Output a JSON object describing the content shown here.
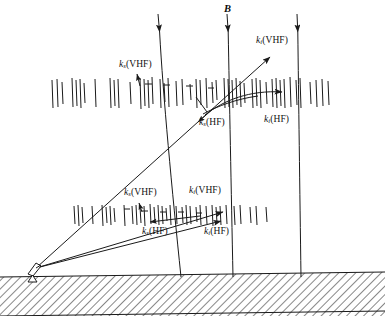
{
  "figure": {
    "kind": "ionospheric-radar-scattering-diagram",
    "background_color": "#ffffff",
    "line_color": "#1a1a1a",
    "width": 385,
    "height": 316
  },
  "magnetic_field": {
    "label": "B",
    "label_position": {
      "x": 224,
      "y": 4
    },
    "arrow_direction": "downward",
    "field_lines": [
      {
        "top_x": 158,
        "top_y": 18,
        "bottom_x": 181,
        "bottom_y": 277
      },
      {
        "top_x": 227,
        "top_y": 18,
        "bottom_x": 233,
        "bottom_y": 277
      },
      {
        "top_x": 297,
        "top_y": 18,
        "bottom_x": 301,
        "bottom_y": 277
      }
    ]
  },
  "labels": {
    "upper_ks_vhf": {
      "k": "k",
      "sub": "s",
      "paren": "(VHF)",
      "x": 119,
      "y": 62
    },
    "upper_ki_vhf": {
      "k": "k",
      "sub": "i",
      "paren": "(VHF)",
      "x": 256,
      "y": 38
    },
    "upper_ks_hf": {
      "k": "k",
      "sub": "s",
      "paren": "(HF)",
      "x": 200,
      "y": 120
    },
    "upper_ki_hf": {
      "k": "k",
      "sub": "i",
      "paren": "(HF)",
      "x": 265,
      "y": 117
    },
    "lower_ks_vhf": {
      "k": "k",
      "sub": "s",
      "paren": "(VHF)",
      "x": 125,
      "y": 190
    },
    "lower_ki_vhf": {
      "k": "k",
      "sub": "i",
      "paren": "(VHF)",
      "x": 190,
      "y": 188
    },
    "lower_ks_hf": {
      "k": "k",
      "sub": "s",
      "paren": "(HF)",
      "x": 143,
      "y": 229
    },
    "lower_ki_hf": {
      "k": "k",
      "sub": "i",
      "paren": "(HF)",
      "x": 205,
      "y": 229
    }
  },
  "antenna": {
    "name": "radar-dish-antenna",
    "position": {
      "x": 30,
      "y": 265
    }
  },
  "ground": {
    "name": "hatched-ground",
    "top_left_y": 277,
    "top_right_y": 272,
    "hatch_angle_deg": 45
  },
  "irregularity_layers": [
    {
      "name": "upper-irregularity-layer",
      "band_y_top": 78,
      "band_y_bottom": 108,
      "tick_x_positions": [
        52,
        57,
        62,
        72,
        76,
        80,
        84,
        95,
        110,
        114,
        118,
        130,
        140,
        144,
        148,
        152,
        160,
        164,
        168,
        176,
        182,
        190,
        196,
        200,
        206,
        212,
        216,
        224,
        228,
        232,
        236,
        240,
        244,
        252,
        256,
        260,
        266,
        272,
        276,
        280,
        284,
        290,
        296,
        300,
        310,
        316,
        322,
        328
      ]
    },
    {
      "name": "lower-irregularity-layer",
      "band_y_top": 204,
      "band_y_bottom": 226,
      "tick_x_positions": [
        74,
        78,
        82,
        92,
        102,
        106,
        110,
        114,
        124,
        132,
        136,
        140,
        144,
        150,
        154,
        158,
        162,
        166,
        170,
        176,
        182,
        186,
        190,
        196,
        200,
        206,
        212,
        216,
        220,
        226,
        234,
        240,
        250,
        256,
        266
      ]
    }
  ],
  "rays": {
    "upper_vhf_incident": {
      "name": "upper-vhf-incident-ray",
      "from": {
        "x": 36,
        "y": 268
      },
      "to": {
        "x": 272,
        "y": 55
      },
      "arrow": "at-end"
    },
    "upper_vhf_scattered": {
      "name": "upper-vhf-scattered-ray",
      "from": {
        "x": 212,
        "y": 110
      },
      "to": {
        "x": 36,
        "y": 268
      },
      "arrow": "at-end"
    },
    "upper_hf_curved": {
      "name": "upper-hf-curved-ray",
      "from": {
        "x": 212,
        "y": 110
      },
      "to": {
        "x": 286,
        "y": 92
      },
      "arrow": "at-end"
    },
    "lower_vhf_incident": {
      "name": "lower-vhf-incident-ray",
      "from": {
        "x": 36,
        "y": 268
      },
      "to": {
        "x": 225,
        "y": 211
      },
      "arrow": "at-end"
    },
    "lower_hf_ray": {
      "name": "lower-hf-ray",
      "from": {
        "x": 36,
        "y": 268
      },
      "to": {
        "x": 222,
        "y": 220
      },
      "arrow": "at-end"
    },
    "lower_vhf_scattered": {
      "name": "lower-vhf-scattered-ray",
      "from": {
        "x": 222,
        "y": 220
      },
      "to": {
        "x": 148,
        "y": 222
      },
      "arrow": "at-end"
    }
  }
}
